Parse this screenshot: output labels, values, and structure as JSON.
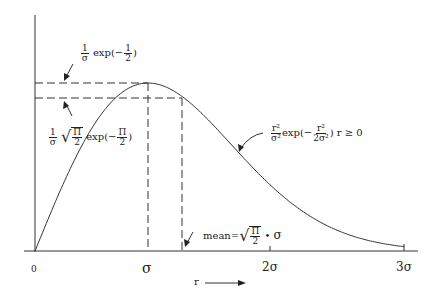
{
  "diagram": {
    "type": "rayleigh-pdf",
    "x_axis": {
      "label": "r",
      "arrow": "→",
      "ticks": [
        {
          "label": "0",
          "x": 35
        },
        {
          "label": "σ",
          "x": 148
        },
        {
          "label": "2σ",
          "x": 270
        },
        {
          "label": "3σ",
          "x": 405
        }
      ]
    },
    "annotations": {
      "peak": {
        "prefix_num": "1",
        "prefix_den": "σ",
        "exp_text": "exp(−",
        "frac_num": "1",
        "frac_den": "2",
        "close": ")"
      },
      "mean_height": {
        "prefix_num": "1",
        "prefix_den": "σ",
        "sqrt_num": "Π",
        "sqrt_den": "2",
        "exp_text": "exp(−",
        "frac_num": "Π",
        "frac_den": "2",
        "close": ")"
      },
      "pdf": {
        "num": "r²",
        "den": "σ²",
        "exp_text": "exp(−",
        "frac_num": "r²",
        "frac_den": "2σ²",
        "condition": ") r ≥ 0"
      },
      "mean": {
        "label": "mean=",
        "sqrt_num": "Π",
        "sqrt_den": "2",
        "dot": "•",
        "sigma": "σ"
      }
    },
    "colors": {
      "ink": "#222222",
      "background": "#ffffff"
    }
  }
}
